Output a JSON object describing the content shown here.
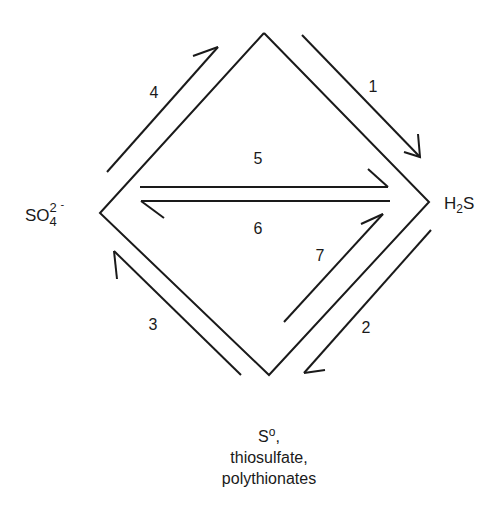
{
  "diagram": {
    "title": "",
    "species": {
      "sulfate": {
        "base": "SO",
        "subscript": "4",
        "superscript": "2",
        "charge": "-"
      },
      "hydrogen_sulfide": {
        "pre": "H",
        "subscript": "2",
        "post": "S"
      },
      "intermediates": {
        "line1_base": "S",
        "line1_sup": "o",
        "line1_suffix": ",",
        "line2": "thiosulfate,",
        "line3": "polythionates"
      }
    },
    "nodes": [
      {
        "id": "top",
        "label": "",
        "x": 264,
        "y": 33
      },
      {
        "id": "sulfate",
        "label": "SO4 2-",
        "x": 100,
        "y": 213
      },
      {
        "id": "hydrogen_sulfide",
        "label": "H2S",
        "x": 429,
        "y": 202
      },
      {
        "id": "intermediates",
        "label": "S0, thiosulfate, polythionates",
        "x": 269,
        "y": 375
      }
    ],
    "edges": [
      {
        "number": "1",
        "label": "1",
        "from": "top",
        "to": "hydrogen_sulfide"
      },
      {
        "number": "2",
        "label": "2",
        "from": "hydrogen_sulfide",
        "to": "intermediates"
      },
      {
        "number": "3",
        "label": "3",
        "from": "intermediates",
        "to": "sulfate"
      },
      {
        "number": "4",
        "label": "4",
        "from": "sulfate",
        "to": "top"
      },
      {
        "number": "5",
        "label": "5",
        "from": "sulfate",
        "to": "hydrogen_sulfide"
      },
      {
        "number": "6",
        "label": "6",
        "from": "hydrogen_sulfide",
        "to": "sulfate"
      },
      {
        "number": "7",
        "label": "7",
        "from": "intermediates",
        "to": "hydrogen_sulfide"
      }
    ],
    "colors": {
      "stroke": "#1a1a1a",
      "background": "#ffffff"
    }
  }
}
